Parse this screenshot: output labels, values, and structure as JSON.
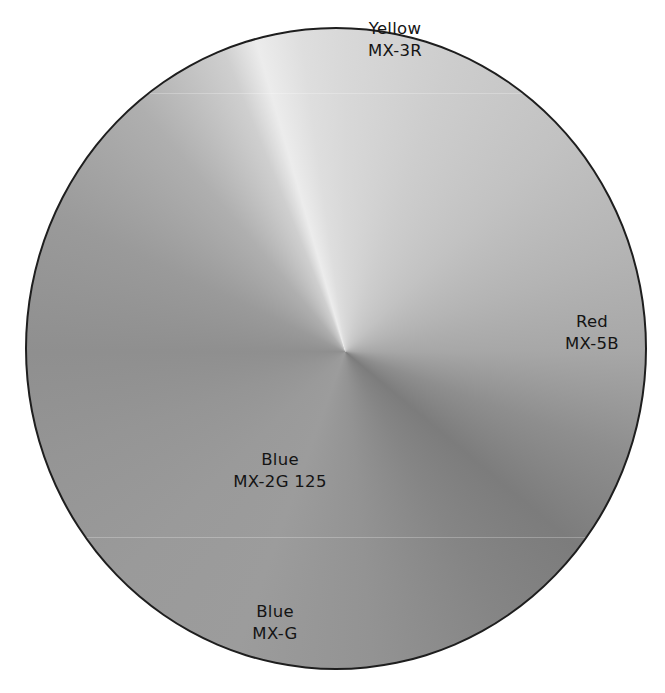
{
  "diagram": {
    "title": "",
    "type": "grayscale conic color wheel",
    "segments": [
      {
        "color_name": "Yellow",
        "code": "MX-3R",
        "position": "top"
      },
      {
        "color_name": "Red",
        "code": "MX-5B",
        "position": "right"
      },
      {
        "color_name": "Blue",
        "code": "MX-2G 125",
        "position": "lower-left"
      },
      {
        "color_name": "Blue",
        "code": "MX-G",
        "position": "bottom"
      }
    ],
    "colors": {
      "outline": "#1e1e1e",
      "highlight": "#ececec",
      "shadow": "#7c7c7c",
      "text": "#141414"
    }
  }
}
